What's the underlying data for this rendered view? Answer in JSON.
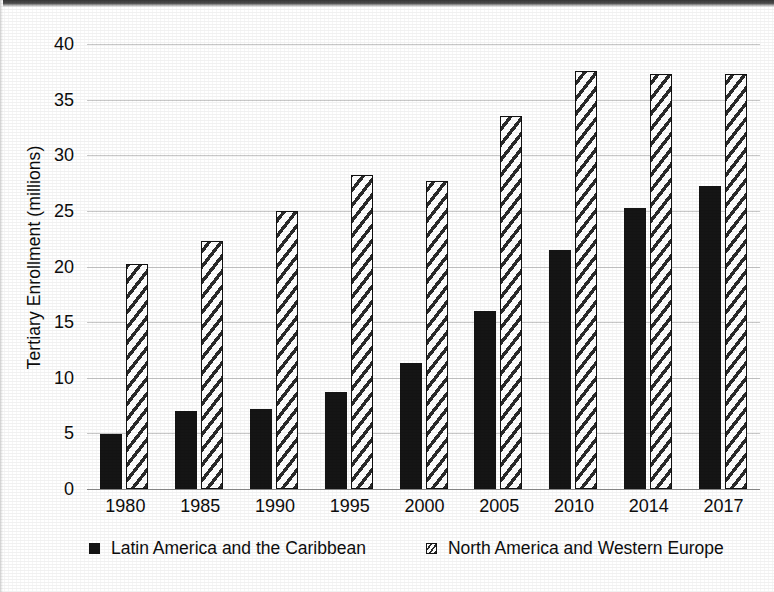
{
  "chart_data": {
    "type": "bar",
    "title": "",
    "subtitle": "",
    "xlabel": "",
    "ylabel": "Tertiary Enrollment (millions)",
    "categories": [
      "1980",
      "1985",
      "1990",
      "1995",
      "2000",
      "2005",
      "2010",
      "2014",
      "2017"
    ],
    "series": [
      {
        "name": "Latin America and the Caribbean",
        "style": "solid-black",
        "color": "#151515",
        "values": [
          4.95,
          7.0,
          7.2,
          8.7,
          11.3,
          16.0,
          21.5,
          25.3,
          27.2
        ]
      },
      {
        "name": "North America and Western Europe",
        "style": "diagonal-hatch",
        "color": "#ffffff",
        "values": [
          20.2,
          22.3,
          25.0,
          28.2,
          27.7,
          33.5,
          37.6,
          37.3,
          37.3
        ]
      }
    ],
    "ylim": [
      0,
      40
    ],
    "yticks": [
      0,
      5,
      10,
      15,
      20,
      25,
      30,
      35,
      40
    ],
    "ytick_labels": [
      "0",
      "5",
      "10",
      "15",
      "20",
      "25",
      "30",
      "35",
      "40"
    ],
    "grid": "horizontal",
    "legend_position": "bottom",
    "grouping": "grouped"
  },
  "legend": {
    "entries": [
      {
        "label": "Latin America and the Caribbean",
        "swatch": "solid-square-marker"
      },
      {
        "label": "North America and Western Europe",
        "swatch": "hatched-square-marker"
      }
    ]
  }
}
